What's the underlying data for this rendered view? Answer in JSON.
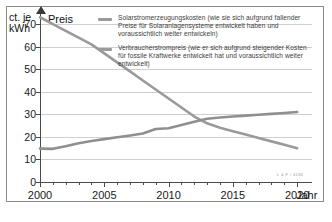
{
  "axes": {
    "y_unit_label": "ct. je\nkWh",
    "y_axis_title": "Preis",
    "x_axis_title": "Jahr",
    "y_ticks": [
      0,
      10,
      20,
      30,
      40,
      50,
      60,
      70
    ],
    "x_ticks": [
      2000,
      2005,
      2010,
      2015,
      2020
    ]
  },
  "legend": {
    "items": [
      {
        "name": "solar-generation-cost",
        "color": "#9a9a9a",
        "label": "Solarstromerzeugungskosten (wie sie sich aufgrund fallender Preise für Solaranlagensysteme entwickelt haben und voraussichtlich weiter entwickeln)"
      },
      {
        "name": "consumer-electricity-price",
        "color": "#9a9a9a",
        "label": "Verbraucherstrompreis (wie er sich aufgrund steigender Kosten für fossile Kraftwerke entwickelt hat und voraussichtlich weiter entwickelt)"
      }
    ]
  },
  "credit": "L & F / 4180",
  "chart_data": {
    "type": "line",
    "title": "",
    "xlabel": "Jahr",
    "ylabel": "Preis",
    "y_unit": "ct. je kWh",
    "xlim": [
      2000,
      2021
    ],
    "ylim": [
      0,
      74
    ],
    "grid": true,
    "legend_position": "top-right",
    "x": [
      2000,
      2001,
      2002,
      2003,
      2004,
      2005,
      2006,
      2007,
      2008,
      2009,
      2010,
      2011,
      2012,
      2013,
      2014,
      2015,
      2016,
      2017,
      2018,
      2019,
      2020
    ],
    "series": [
      {
        "name": "Solarstromerzeugungskosten",
        "color": "#9a9a9a",
        "values": [
          73,
          70,
          67,
          64,
          61,
          57,
          53,
          49,
          45,
          41,
          37,
          33,
          29,
          26,
          24,
          22.5,
          21,
          19.5,
          18,
          16.5,
          15
        ]
      },
      {
        "name": "Verbraucherstrompreis",
        "color": "#8f8f8f",
        "values": [
          14.8,
          14.7,
          15.8,
          17.2,
          18.2,
          19.0,
          19.8,
          20.6,
          21.5,
          23.5,
          23.8,
          25.3,
          26.7,
          28.0,
          28.6,
          29.0,
          29.4,
          29.8,
          30.2,
          30.6,
          31.0
        ]
      }
    ],
    "crossover": {
      "year": 2012,
      "value": 27
    }
  }
}
